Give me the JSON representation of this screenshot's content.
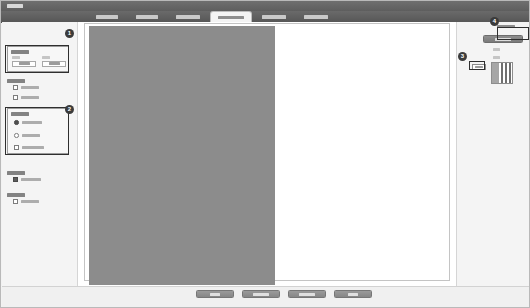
{
  "window": {
    "title": "设置",
    "title_redacted": true
  },
  "tabs": [
    {
      "label": "常规设置",
      "active": false,
      "x": 88,
      "w": 36
    },
    {
      "label": "纸张设置",
      "active": false,
      "x": 128,
      "w": 36
    },
    {
      "label": "布局设置",
      "active": false,
      "x": 168,
      "w": 38
    },
    {
      "label": "高级设置",
      "active": true,
      "x": 210,
      "w": 40
    },
    {
      "label": "颜色设置",
      "active": false,
      "x": 254,
      "w": 38
    },
    {
      "label": "输出设置",
      "active": false,
      "x": 296,
      "w": 38
    }
  ],
  "sidebar": {
    "groups": [
      {
        "name": "size-group",
        "title": "尺寸设置",
        "kind": "box",
        "top": 24,
        "height": 26,
        "fields": [
          {
            "label": "宽度",
            "value": "210.0"
          },
          {
            "label": "高度",
            "value": "297.0"
          }
        ]
      },
      {
        "name": "print-group",
        "title": "打印设置",
        "kind": "plain",
        "top": 54,
        "height": 28,
        "options": [
          {
            "label": "双面打印",
            "control": "checkbox",
            "checked": false
          },
          {
            "label": "缩放打印",
            "control": "checkbox",
            "checked": false
          }
        ]
      },
      {
        "name": "image-group",
        "title": "图像设置",
        "kind": "box",
        "top": 86,
        "height": 46,
        "options": [
          {
            "label": "标准质量",
            "control": "radio",
            "checked": true
          },
          {
            "label": "高清质量",
            "control": "radio",
            "checked": false
          },
          {
            "label": "自定义质量",
            "control": "checkbox",
            "checked": false
          }
        ]
      },
      {
        "name": "watermark-group",
        "title": "水印设置",
        "kind": "plain",
        "top": 146,
        "height": 18,
        "options": [
          {
            "label": "添加水印",
            "control": "checkbox",
            "checked": true
          }
        ]
      },
      {
        "name": "security-group",
        "title": "安全设置",
        "kind": "plain",
        "top": 168,
        "height": 18,
        "options": [
          {
            "label": "加密文档",
            "control": "checkbox",
            "checked": false
          }
        ]
      }
    ]
  },
  "canvas": {
    "page_label": "预览页面",
    "block_label": "文档内容区"
  },
  "right_panel": {
    "auto_label": "自动排版",
    "apply_button": "应用设置",
    "fields": [
      {
        "label": "宽度",
        "value": ""
      },
      {
        "label": "间距",
        "value": ""
      },
      {
        "label": "页数",
        "value": "1"
      }
    ],
    "thumbnail_label": "页面缩略图"
  },
  "footer": {
    "buttons": [
      {
        "label": "确定",
        "x": 194
      },
      {
        "label": "应用设置",
        "x": 240
      },
      {
        "label": "恢复默认",
        "x": 286
      },
      {
        "label": "取消",
        "x": 332
      }
    ]
  },
  "badges": [
    {
      "number": "1",
      "x": 64,
      "y": 28
    },
    {
      "number": "2",
      "x": 64,
      "y": 104
    },
    {
      "number": "3",
      "x": 457,
      "y": 51
    },
    {
      "number": "4",
      "x": 489,
      "y": 16
    }
  ],
  "colors": {
    "titlebar": "#5e5e5e",
    "tabbar": "#575757",
    "active_tab": "#f4f4f4",
    "panel_bg": "#f4f4f4",
    "canvas_bg": "#ffffff",
    "doc_block": "#8c8c8c",
    "badge": "#3b3b3b",
    "button": "#868686"
  }
}
